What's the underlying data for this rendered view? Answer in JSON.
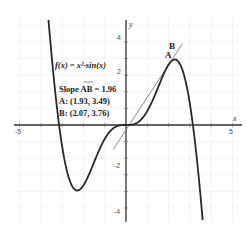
{
  "chart_data": {
    "type": "line",
    "title": "",
    "xlabel": "x",
    "ylabel": "y",
    "xlim": [
      -5.3,
      5.3
    ],
    "ylim": [
      -4.5,
      5
    ],
    "x_ticks": [
      "-5",
      "5"
    ],
    "y_ticks": [
      "4",
      "2",
      "-2",
      "-4"
    ],
    "grid": true,
    "series": [
      {
        "name": "f(x) = x²·sin(x)",
        "type": "curve",
        "color": "#333333"
      },
      {
        "name": "secant AB",
        "type": "line",
        "slope": 1.96,
        "through": [
          1.93,
          3.49
        ],
        "color": "#888888"
      }
    ],
    "points": [
      {
        "label": "A",
        "x": 1.93,
        "y": 3.49
      },
      {
        "label": "B",
        "x": 2.07,
        "y": 3.76
      }
    ],
    "annotations": [
      "f(x) = x²·sin(x)",
      "Slope AB = 1.96",
      "A: (1.93, 3.49)",
      "B: (2.07, 3.76)"
    ]
  },
  "labels": {
    "func": "f(x) = x²·sin(x)",
    "slope": "Slope AB = 1.96",
    "pointA": "A: (1.93, 3.49)",
    "pointB": "B: (2.07, 3.76)",
    "markA": "A",
    "markB": "B",
    "xname": "x",
    "yname": "y",
    "xtick_neg5": "-5",
    "xtick_5": "5",
    "ytick_4": "4",
    "ytick_2": "2",
    "ytick_m2": "-2",
    "ytick_m4": "-4"
  }
}
